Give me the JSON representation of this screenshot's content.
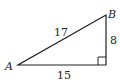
{
  "diagram": {
    "type": "right-triangle",
    "vertices": [
      {
        "id": "A",
        "label": "A"
      },
      {
        "id": "B",
        "label": "B"
      },
      {
        "id": "C",
        "label": ""
      }
    ],
    "sides": {
      "hypotenuse": {
        "from": "A",
        "to": "B",
        "length": "17"
      },
      "vertical": {
        "from": "B",
        "to": "C",
        "length": "8"
      },
      "base": {
        "from": "A",
        "to": "C",
        "length": "15"
      }
    },
    "right_angle_at": "C",
    "stroke_color": "#222222"
  }
}
